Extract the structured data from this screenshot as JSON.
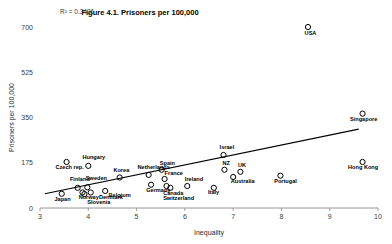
{
  "chart_data": {
    "type": "scatter",
    "title": "Figure 4.1. Prisoners per 100,000",
    "xlabel": "Inequality",
    "ylabel": "Prisoners per 100,000",
    "xlim": [
      3,
      10
    ],
    "ylim": [
      0,
      700
    ],
    "xticks": [
      "3",
      "4",
      "5",
      "6",
      "7",
      "8",
      "9",
      "10"
    ],
    "yticks": [
      "0",
      "175",
      "350",
      "525",
      "700"
    ],
    "grid": false,
    "legend": false,
    "annotation_r2": "R² = 0.3436",
    "trendline": {
      "x0": 3.1,
      "y0": 55,
      "x1": 9.6,
      "y1": 305
    },
    "points": [
      {
        "label": "Japan",
        "x": 3.45,
        "y": 55,
        "lx": 3.3,
        "ly": 28
      },
      {
        "label": "Czech rep.",
        "x": 3.55,
        "y": 178,
        "lx": 3.32,
        "ly": 152
      },
      {
        "label": "Hungary",
        "x": 4.0,
        "y": 163,
        "lx": 3.88,
        "ly": 190
      },
      {
        "label": "Finland",
        "x": 3.78,
        "y": 78,
        "lx": 3.62,
        "ly": 105
      },
      {
        "label": "Norway",
        "x": 3.88,
        "y": 60,
        "lx": 3.8,
        "ly": 33
      },
      {
        "label": "Sweden",
        "x": 3.98,
        "y": 80,
        "lx": 3.95,
        "ly": 108
      },
      {
        "label": "Slovenia",
        "x": 3.92,
        "y": 54,
        "lx": 3.98,
        "ly": 17
      },
      {
        "label": "Denmark",
        "x": 4.05,
        "y": 60,
        "lx": 4.22,
        "ly": 33
      },
      {
        "label": "Belgium",
        "x": 4.35,
        "y": 66,
        "lx": 4.42,
        "ly": 43
      },
      {
        "label": "Korea",
        "x": 4.65,
        "y": 118,
        "lx": 4.52,
        "ly": 140
      },
      {
        "label": "Netherlands",
        "x": 5.25,
        "y": 128,
        "lx": 5.02,
        "ly": 150
      },
      {
        "label": "Germany",
        "x": 5.3,
        "y": 90,
        "lx": 5.2,
        "ly": 62
      },
      {
        "label": "Spain",
        "x": 5.52,
        "y": 148,
        "lx": 5.48,
        "ly": 168
      },
      {
        "label": "France",
        "x": 5.58,
        "y": 112,
        "lx": 5.58,
        "ly": 128
      },
      {
        "label": "Canada",
        "x": 5.62,
        "y": 85,
        "lx": 5.55,
        "ly": 52
      },
      {
        "label": "Switzerland",
        "x": 5.7,
        "y": 78,
        "lx": 5.55,
        "ly": 32
      },
      {
        "label": "Ireland",
        "x": 6.05,
        "y": 85,
        "lx": 6.0,
        "ly": 105
      },
      {
        "label": "Italy",
        "x": 6.6,
        "y": 78,
        "lx": 6.48,
        "ly": 53
      },
      {
        "label": "Israel",
        "x": 6.8,
        "y": 205,
        "lx": 6.72,
        "ly": 228
      },
      {
        "label": "NZ",
        "x": 6.82,
        "y": 148,
        "lx": 6.78,
        "ly": 168
      },
      {
        "label": "UK",
        "x": 7.15,
        "y": 140,
        "lx": 7.1,
        "ly": 160
      },
      {
        "label": "Australia",
        "x": 7.0,
        "y": 120,
        "lx": 6.95,
        "ly": 95
      },
      {
        "label": "Portugal",
        "x": 7.98,
        "y": 125,
        "lx": 7.85,
        "ly": 98
      },
      {
        "label": "USA",
        "x": 8.55,
        "y": 700,
        "lx": 8.48,
        "ly": 668
      },
      {
        "label": "Singapore",
        "x": 9.68,
        "y": 365,
        "lx": 9.42,
        "ly": 337
      },
      {
        "label": "Hong Kong",
        "x": 9.68,
        "y": 178,
        "lx": 9.38,
        "ly": 150
      }
    ]
  }
}
